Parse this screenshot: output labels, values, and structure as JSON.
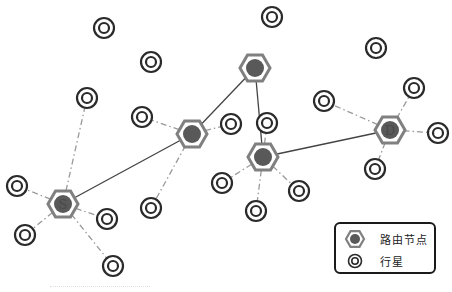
{
  "colors": {
    "router_outline": "#808080",
    "router_fill": "#595959",
    "planet_ring": "#2a2a2a",
    "solid_link": "#444444",
    "dashed_link": "#9a9a9a",
    "label_text": "#4a4a4a"
  },
  "routers": [
    {
      "id": "S",
      "label": "S",
      "x": 63,
      "y": 204
    },
    {
      "id": "R1",
      "label": "",
      "x": 192,
      "y": 134
    },
    {
      "id": "R2",
      "label": "",
      "x": 255,
      "y": 68
    },
    {
      "id": "R3",
      "label": "",
      "x": 263,
      "y": 157
    },
    {
      "id": "D",
      "label": "D",
      "x": 390,
      "y": 130
    }
  ],
  "planets": [
    {
      "x": 104,
      "y": 28
    },
    {
      "x": 272,
      "y": 17
    },
    {
      "x": 151,
      "y": 62
    },
    {
      "x": 376,
      "y": 48
    },
    {
      "x": 87,
      "y": 98
    },
    {
      "x": 142,
      "y": 117
    },
    {
      "x": 231,
      "y": 124
    },
    {
      "x": 324,
      "y": 101
    },
    {
      "x": 414,
      "y": 88
    },
    {
      "x": 438,
      "y": 133
    },
    {
      "x": 17,
      "y": 186
    },
    {
      "x": 25,
      "y": 235
    },
    {
      "x": 107,
      "y": 219
    },
    {
      "x": 113,
      "y": 266
    },
    {
      "x": 151,
      "y": 208
    },
    {
      "x": 267,
      "y": 123
    },
    {
      "x": 222,
      "y": 183
    },
    {
      "x": 256,
      "y": 211
    },
    {
      "x": 299,
      "y": 191
    },
    {
      "x": 375,
      "y": 169
    }
  ],
  "solid_links": [
    {
      "from": "S",
      "to": "R1"
    },
    {
      "from": "R1",
      "to": "R2"
    },
    {
      "from": "R2",
      "to": "R3"
    },
    {
      "from": "R3",
      "to": "D"
    }
  ],
  "dashed_links": [
    {
      "router": "S",
      "planet": 4
    },
    {
      "router": "S",
      "planet": 10
    },
    {
      "router": "S",
      "planet": 11
    },
    {
      "router": "S",
      "planet": 12
    },
    {
      "router": "S",
      "planet": 13
    },
    {
      "router": "R1",
      "planet": 5
    },
    {
      "router": "R1",
      "planet": 6
    },
    {
      "router": "R1",
      "planet": 14
    },
    {
      "router": "R3",
      "planet": 15
    },
    {
      "router": "R3",
      "planet": 16
    },
    {
      "router": "R3",
      "planet": 17
    },
    {
      "router": "R3",
      "planet": 18
    },
    {
      "router": "D",
      "planet": 7
    },
    {
      "router": "D",
      "planet": 8
    },
    {
      "router": "D",
      "planet": 9
    },
    {
      "router": "D",
      "planet": 19
    }
  ],
  "legend": {
    "router_label": "路由节点",
    "planet_label": "行星"
  }
}
